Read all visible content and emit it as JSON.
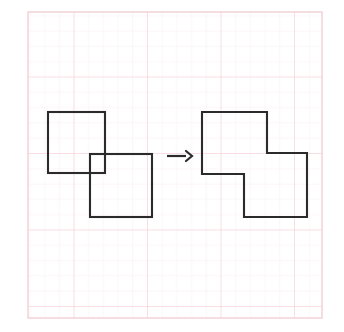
{
  "figure": {
    "background_color": "#ffffff",
    "paper": {
      "name": "graph-paper",
      "x": 28,
      "y": 12,
      "width": 294,
      "height": 306,
      "border_color": "#f3cfd4",
      "minor_grid_color": "#faeef0",
      "major_grid_color": "#f6c9d0",
      "minor_spacing_x": 14.7,
      "minor_spacing_y": 15.3,
      "major_spacing_x": 73.5,
      "major_spacing_y": 76.5
    },
    "stroke_color": "#2b2b2b",
    "stroke_width": 2.1,
    "shapes": [
      {
        "name": "left-square-upper",
        "type": "rect",
        "x": 48,
        "y": 112,
        "width": 57,
        "height": 61
      },
      {
        "name": "left-square-lower",
        "type": "rect",
        "x": 90,
        "y": 154,
        "width": 62,
        "height": 63
      },
      {
        "name": "right-stepped-polygon",
        "type": "polygon",
        "points": "202,112 267,112 267,153 307,153 307,217 244,217 244,174 202,174"
      }
    ],
    "arrow": {
      "name": "transformation-arrow",
      "label": "→",
      "shaft_x1": 167,
      "shaft_x2": 186,
      "y": 156,
      "head_points": "186,151 192,156 186,161",
      "stroke_width": 2.2
    }
  }
}
